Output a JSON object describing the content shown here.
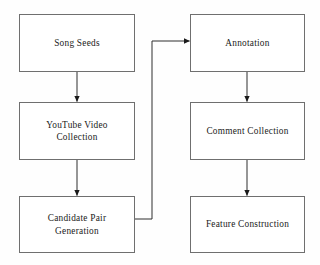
{
  "diagram": {
    "type": "flowchart",
    "orientation": "two-column top-to-bottom",
    "background_color": "#ffffff",
    "border_color": "#6f6f6f",
    "text_color": "#1a1a1a",
    "nodes": [
      {
        "id": "song-seeds",
        "label": "Song Seeds",
        "column": "left",
        "row": 1,
        "x": 19,
        "y": 14,
        "width": 116,
        "height": 58
      },
      {
        "id": "youtube-video-collection",
        "label": "YouTube Video\nCollection",
        "column": "left",
        "row": 2,
        "x": 19,
        "y": 102,
        "width": 116,
        "height": 58
      },
      {
        "id": "candidate-pair-generation",
        "label": "Candidate Pair\nGeneration",
        "column": "left",
        "row": 3,
        "x": 19,
        "y": 196,
        "width": 116,
        "height": 57
      },
      {
        "id": "annotation",
        "label": "Annotation",
        "column": "right",
        "row": 1,
        "x": 190,
        "y": 14,
        "width": 115,
        "height": 58
      },
      {
        "id": "comment-collection",
        "label": "Comment Collection",
        "column": "right",
        "row": 2,
        "x": 190,
        "y": 102,
        "width": 115,
        "height": 58
      },
      {
        "id": "feature-construction",
        "label": "Feature Construction",
        "column": "right",
        "row": 3,
        "x": 190,
        "y": 196,
        "width": 115,
        "height": 57
      }
    ],
    "edges": [
      {
        "id": "edge-song-seeds-to-youtube",
        "from": "song-seeds",
        "to": "youtube-video-collection",
        "style": "straight-vertical",
        "arrowhead": true
      },
      {
        "id": "edge-youtube-to-candidate",
        "from": "youtube-video-collection",
        "to": "candidate-pair-generation",
        "style": "straight-vertical",
        "arrowhead": true
      },
      {
        "id": "edge-candidate-to-annotation",
        "from": "candidate-pair-generation",
        "to": "annotation",
        "style": "elbow-right-up-right",
        "arrowhead": true
      },
      {
        "id": "edge-annotation-to-comment",
        "from": "annotation",
        "to": "comment-collection",
        "style": "straight-vertical",
        "arrowhead": true
      },
      {
        "id": "edge-comment-to-feature",
        "from": "comment-collection",
        "to": "feature-construction",
        "style": "straight-vertical",
        "arrowhead": true
      }
    ]
  }
}
